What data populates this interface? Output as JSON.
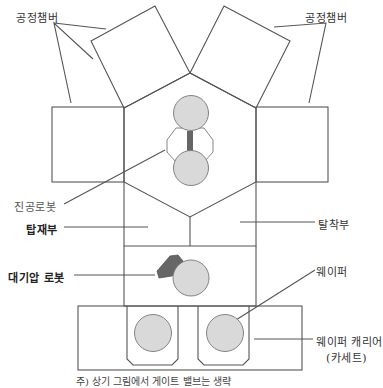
{
  "labels": {
    "process_chamber_left": "공정챔버",
    "process_chamber_right": "공정챔버",
    "vacuum_robot": "진공로봇",
    "load_section": "탑재부",
    "unload_section": "탈착부",
    "atmospheric_robot": "대기압 로봇",
    "wafer": "웨이퍼",
    "wafer_carrier_line1": "웨이퍼 캐리어",
    "wafer_carrier_line2": "(카세트)"
  },
  "footnote": "주) 상기 그림에서 게이트 밸브는 생략",
  "colors": {
    "line": "#555555",
    "wafer_fill": "#d9d9d9",
    "robot_arm": "#666666",
    "background": "#ffffff"
  }
}
